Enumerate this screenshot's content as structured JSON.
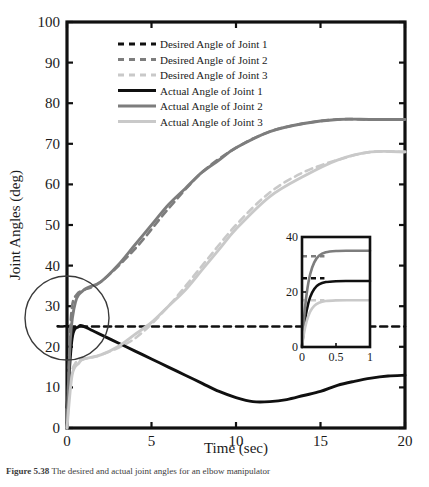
{
  "figure": {
    "caption_label": "Figure 5.38",
    "caption_text": "The desired and actual joint angles for an elbow manipulator"
  },
  "chart_data": {
    "type": "line",
    "title": "",
    "xlabel": "Time (sec)",
    "ylabel": "Joint Angles (deg)",
    "xlim": [
      0,
      20
    ],
    "ylim": [
      0,
      100
    ],
    "xticks": [
      0,
      5,
      10,
      15,
      20
    ],
    "yticks": [
      0,
      10,
      20,
      30,
      40,
      50,
      60,
      70,
      80,
      90,
      100
    ],
    "grid": false,
    "legend_position": "top-center",
    "series": [
      {
        "name": "Desired Angle of Joint 1",
        "style": "dashed",
        "color": "#101010",
        "x": [
          0,
          0.15,
          0.3,
          0.5,
          1,
          20
        ],
        "values": [
          0,
          18,
          24,
          25,
          25,
          25
        ]
      },
      {
        "name": "Desired Angle of Joint 2",
        "style": "dashed",
        "color": "#7d7d7d",
        "x": [
          0,
          0.15,
          0.3,
          0.6,
          1,
          2,
          4,
          6,
          8,
          10,
          12,
          14,
          16,
          18,
          20
        ],
        "values": [
          0,
          20,
          30,
          33,
          34,
          36,
          44,
          54,
          63,
          69,
          73,
          75,
          76,
          76,
          76
        ]
      },
      {
        "name": "Desired Angle of Joint 3",
        "style": "dashed",
        "color": "#c9c9c9",
        "x": [
          0,
          0.2,
          0.5,
          1,
          2,
          4,
          6,
          8,
          10,
          12,
          14,
          16,
          18,
          20
        ],
        "values": [
          0,
          12,
          16,
          17,
          18,
          22,
          30,
          40,
          50,
          58,
          63,
          66,
          68,
          68
        ]
      },
      {
        "name": "Actual Angle of Joint 1",
        "style": "solid",
        "color": "#101010",
        "x": [
          0,
          0.3,
          0.7,
          1,
          1.5,
          2,
          3,
          4,
          5,
          6,
          7,
          8,
          9,
          10,
          11,
          12,
          13,
          14,
          15,
          16,
          17,
          18,
          19,
          20
        ],
        "values": [
          5,
          22,
          25,
          25,
          24,
          23,
          21,
          19,
          17,
          15,
          13,
          11,
          9,
          7.5,
          6.5,
          6.5,
          7,
          8,
          9,
          10.5,
          11.5,
          12.3,
          12.8,
          13
        ],
        "min_value": 6.5,
        "min_at_time": 11.3,
        "peak_value": 25,
        "peak_at_time": 0.9
      },
      {
        "name": "Actual Angle of Joint 2",
        "style": "solid",
        "color": "#7d7d7d",
        "x": [
          0,
          0.2,
          0.5,
          1,
          2,
          3,
          4,
          5,
          6,
          7,
          8,
          9,
          10,
          12,
          14,
          16,
          18,
          20
        ],
        "values": [
          0,
          22,
          31,
          34,
          36,
          40,
          45,
          50,
          55,
          59,
          63,
          66,
          69,
          73,
          75,
          76,
          76,
          76
        ],
        "final_value": 76
      },
      {
        "name": "Actual Angle of Joint 3",
        "style": "solid",
        "color": "#c9c9c9",
        "x": [
          0,
          0.3,
          0.7,
          1,
          2,
          3,
          4,
          5,
          6,
          7,
          8,
          9,
          10,
          12,
          14,
          16,
          18,
          20
        ],
        "values": [
          0,
          13,
          16,
          17,
          18,
          20,
          23,
          26,
          30,
          34,
          39,
          44,
          49,
          57,
          62,
          66,
          68,
          68
        ],
        "final_value": 68
      }
    ],
    "inset": {
      "xlim": [
        0,
        1
      ],
      "ylim": [
        0,
        40
      ],
      "xticks": [
        0,
        0.5,
        1
      ],
      "xtick_labels": [
        "0",
        "0.5",
        "1"
      ],
      "yticks": [
        0,
        20,
        40
      ],
      "ytick_labels": [
        "0",
        "20",
        "40"
      ],
      "series": [
        {
          "name": "Desired Angle of Joint 1",
          "style": "dashed",
          "color": "#101010",
          "level": 25
        },
        {
          "name": "Desired Angle of Joint 2",
          "style": "dashed",
          "color": "#7d7d7d",
          "level": 33
        },
        {
          "name": "Desired Angle of Joint 3",
          "style": "dashed",
          "color": "#c9c9c9",
          "level": 17
        },
        {
          "name": "Actual Angle of Joint 1",
          "style": "solid",
          "color": "#101010",
          "settles_to": 24
        },
        {
          "name": "Actual Angle of Joint 2",
          "style": "solid",
          "color": "#7d7d7d",
          "settles_to": 35
        },
        {
          "name": "Actual Angle of Joint 3",
          "style": "solid",
          "color": "#c9c9c9",
          "settles_to": 17
        }
      ]
    },
    "annotation": {
      "type": "circle",
      "description": "zoom-callout-circle",
      "center_time": 0.0,
      "center_angle": 27
    }
  },
  "axis": {
    "x_tick_labels": [
      "0",
      "5",
      "10",
      "15",
      "20"
    ],
    "y_tick_labels": [
      "0",
      "10",
      "20",
      "30",
      "40",
      "50",
      "60",
      "70",
      "80",
      "90",
      "100"
    ],
    "x_title": "Time (sec)",
    "y_title": "Joint Angles (deg)"
  },
  "legend": {
    "items": [
      {
        "label": "Desired Angle of Joint 1",
        "color": "#101010",
        "style": "dashed"
      },
      {
        "label": "Desired Angle of Joint 2",
        "color": "#7d7d7d",
        "style": "dashed"
      },
      {
        "label": "Desired Angle of Joint 3",
        "color": "#c9c9c9",
        "style": "dashed"
      },
      {
        "label": "Actual Angle of Joint 1",
        "color": "#101010",
        "style": "solid"
      },
      {
        "label": "Actual Angle of Joint 2",
        "color": "#7d7d7d",
        "style": "solid"
      },
      {
        "label": "Actual Angle of Joint 3",
        "color": "#c9c9c9",
        "style": "solid"
      }
    ]
  }
}
